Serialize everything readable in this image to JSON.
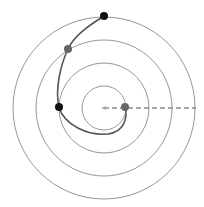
{
  "diagram": {
    "type": "concentric-circles-with-spiral-path",
    "center": [
      104,
      108
    ],
    "circle_radii": [
      22,
      45,
      68,
      91
    ],
    "circle_color": "#8a8a8a",
    "path_color": "#555555",
    "dashed_line_color": "#8a8a8a",
    "points": [
      {
        "name": "outer-point",
        "x": 104,
        "y": 16,
        "color": "#111111"
      },
      {
        "name": "upper-mid-point",
        "x": 68,
        "y": 49,
        "color": "#666666"
      },
      {
        "name": "left-point",
        "x": 59,
        "y": 107,
        "color": "#111111"
      },
      {
        "name": "inner-point",
        "x": 125,
        "y": 107,
        "color": "#666666"
      }
    ]
  }
}
